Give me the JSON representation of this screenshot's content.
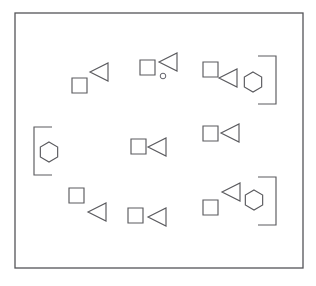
{
  "figure": {
    "background_color": "#ffffff",
    "stroke_color": "#5a5a5e",
    "frame_stroke_color": "#545458",
    "width": 316,
    "height": 286
  },
  "frame": {
    "name": "outer-border",
    "x": 15,
    "y": 13,
    "width": 288,
    "height": 255
  },
  "legend": {
    "square_label": "square",
    "triangle_label": "left-pointing-triangle",
    "hexagon_label": "hexagon",
    "bracket_label": "bracket",
    "circle_label": "small-circle"
  },
  "groups": [
    {
      "id": "group-top-left",
      "label": "Top Left Group",
      "shapes": [
        {
          "kind": "square",
          "name": "square",
          "x": 72,
          "y": 78,
          "size": 15
        },
        {
          "kind": "triangle",
          "name": "triangle",
          "x": 90,
          "y": 63,
          "size": 18,
          "direction": "left"
        }
      ]
    },
    {
      "id": "group-top-center",
      "label": "Top Center Group",
      "shapes": [
        {
          "kind": "square",
          "name": "square",
          "x": 140,
          "y": 60,
          "size": 15
        },
        {
          "kind": "triangle",
          "name": "triangle",
          "x": 159,
          "y": 53,
          "size": 18,
          "direction": "left"
        },
        {
          "kind": "circle",
          "name": "circle",
          "cx": 163,
          "cy": 76,
          "r": 2.8
        }
      ]
    },
    {
      "id": "group-top-right",
      "label": "Top Right Group",
      "shapes": [
        {
          "kind": "square",
          "name": "square",
          "x": 203,
          "y": 62,
          "size": 15
        },
        {
          "kind": "triangle",
          "name": "triangle",
          "x": 219,
          "y": 69,
          "size": 18,
          "direction": "left"
        },
        {
          "kind": "hexagon",
          "name": "hexagon",
          "cx": 253,
          "cy": 82,
          "r": 10
        },
        {
          "kind": "bracket",
          "name": "bracket",
          "x": 258,
          "y": 56,
          "width": 18,
          "height": 48,
          "direction": "right"
        }
      ]
    },
    {
      "id": "group-mid-left",
      "label": "Middle Left Group",
      "shapes": [
        {
          "kind": "bracket",
          "name": "bracket",
          "x": 34,
          "y": 127,
          "width": 18,
          "height": 48,
          "direction": "left"
        },
        {
          "kind": "hexagon",
          "name": "hexagon",
          "cx": 49,
          "cy": 152,
          "r": 10
        }
      ]
    },
    {
      "id": "group-mid-center",
      "label": "Middle Center Group",
      "shapes": [
        {
          "kind": "square",
          "name": "square",
          "x": 131,
          "y": 139,
          "size": 15
        },
        {
          "kind": "triangle",
          "name": "triangle",
          "x": 148,
          "y": 138,
          "size": 18,
          "direction": "left"
        }
      ]
    },
    {
      "id": "group-mid-right",
      "label": "Middle Right Group",
      "shapes": [
        {
          "kind": "square",
          "name": "square",
          "x": 203,
          "y": 126,
          "size": 15
        },
        {
          "kind": "triangle",
          "name": "triangle",
          "x": 221,
          "y": 124,
          "size": 18,
          "direction": "left"
        }
      ]
    },
    {
      "id": "group-bottom-left",
      "label": "Bottom Left Group",
      "shapes": [
        {
          "kind": "square",
          "name": "square",
          "x": 69,
          "y": 188,
          "size": 15
        },
        {
          "kind": "triangle",
          "name": "triangle",
          "x": 88,
          "y": 203,
          "size": 18,
          "direction": "left"
        }
      ]
    },
    {
      "id": "group-bottom-center",
      "label": "Bottom Center Group",
      "shapes": [
        {
          "kind": "square",
          "name": "square",
          "x": 128,
          "y": 208,
          "size": 15
        },
        {
          "kind": "triangle",
          "name": "triangle",
          "x": 148,
          "y": 208,
          "size": 18,
          "direction": "left"
        }
      ]
    },
    {
      "id": "group-bottom-right",
      "label": "Bottom Right Group",
      "shapes": [
        {
          "kind": "square",
          "name": "square",
          "x": 203,
          "y": 200,
          "size": 15
        },
        {
          "kind": "triangle",
          "name": "triangle",
          "x": 222,
          "y": 183,
          "size": 18,
          "direction": "left"
        },
        {
          "kind": "hexagon",
          "name": "hexagon",
          "cx": 254,
          "cy": 200,
          "r": 10
        },
        {
          "kind": "bracket",
          "name": "bracket",
          "x": 258,
          "y": 177,
          "width": 18,
          "height": 48,
          "direction": "right"
        }
      ]
    }
  ]
}
